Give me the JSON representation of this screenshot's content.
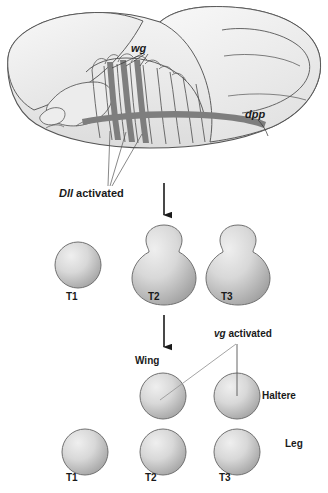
{
  "figure": {
    "type": "biology-schematic"
  },
  "embryo": {
    "labels": {
      "wg": "wg",
      "dpp": "dpp",
      "dll_gene": "Dll",
      "dll_state": " activated"
    },
    "colors": {
      "body_fill_light": "#f2f2f2",
      "body_fill_mid": "#e3e3e3",
      "outline": "#555555",
      "stripe": "#7e7e7e"
    }
  },
  "disc_row_primordia": {
    "items": [
      {
        "label": "T1",
        "shape": "circle"
      },
      {
        "label": "T2",
        "shape": "bulb"
      },
      {
        "label": "T3",
        "shape": "bulb"
      }
    ]
  },
  "disc_row_fates": {
    "vg_gene": "vg",
    "vg_state": " activated",
    "wing_label": "Wing",
    "haltere_label": "Haltere",
    "leg_label": "Leg",
    "leg_items": [
      {
        "label": "T1"
      },
      {
        "label": "T2"
      },
      {
        "label": "T3"
      }
    ]
  },
  "arrows": {
    "count": 2,
    "direction": "down"
  },
  "colors": {
    "disc_fill_light": "#e8e8e8",
    "disc_fill_dark": "#9e9e9e",
    "disc_outline": "#707070",
    "leader_line": "#8a8a8a",
    "text": "#1a1a1a"
  }
}
